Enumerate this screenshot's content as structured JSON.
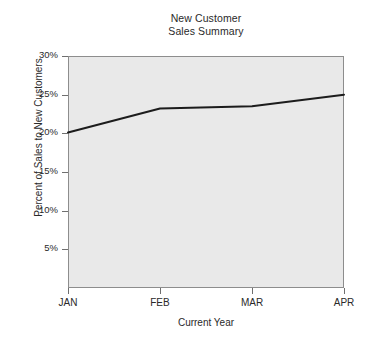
{
  "chart_data": {
    "type": "line",
    "title": "New Customer Sales Summary",
    "title_lines": [
      "New Customer",
      "Sales Summary"
    ],
    "xlabel": "Current Year",
    "ylabel": "Percent of Sales to New Customers",
    "categories": [
      "JAN",
      "FEB",
      "MAR",
      "APR"
    ],
    "values": [
      20.1,
      23.2,
      23.5,
      25.0
    ],
    "series": [
      {
        "name": "Percent of Sales to New Customers",
        "values": [
          20.1,
          23.2,
          23.5,
          25.0
        ],
        "color": "#1c1c1c"
      }
    ],
    "ylim": [
      0,
      30
    ],
    "xlim": [
      0,
      3
    ],
    "y_ticks": [
      5,
      10,
      15,
      20,
      25,
      30
    ],
    "y_tick_labels": [
      "5%",
      "10%",
      "15%",
      "20%",
      "25%",
      "30%"
    ],
    "x_ticks": [
      0,
      1,
      2,
      3
    ],
    "x_tick_labels": [
      "JAN",
      "FEB",
      "MAR",
      "APR"
    ],
    "grid": false,
    "legend": "none",
    "plot_background": "#e9e9e9",
    "frame_color": "#8d8d8d",
    "line_color": "#1c1c1c",
    "line_width": 2,
    "page_background": "#ffffff"
  }
}
